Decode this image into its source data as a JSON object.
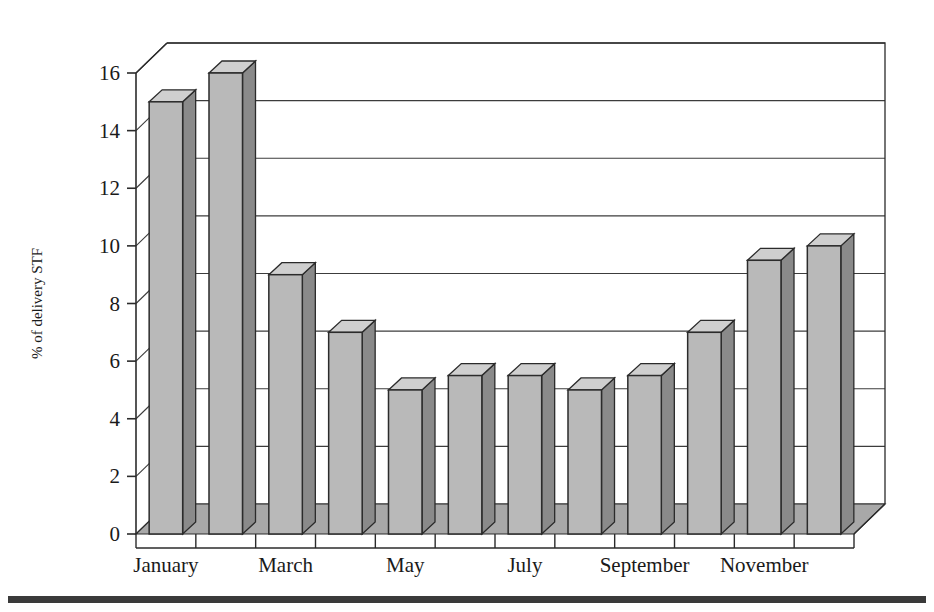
{
  "chart_data": {
    "type": "bar",
    "title": "",
    "subtitle": "",
    "xlabel": "",
    "ylabel": "% of delivery STF",
    "categories": [
      "January",
      "February",
      "March",
      "April",
      "May",
      "June",
      "July",
      "August",
      "September",
      "October",
      "November",
      "December"
    ],
    "values": [
      15,
      16,
      9,
      7,
      5,
      5.5,
      5.5,
      5,
      5.5,
      7,
      9.5,
      10
    ],
    "series": [
      {
        "name": "% of delivery STF",
        "values": [
          15,
          16,
          9,
          7,
          5,
          5.5,
          5.5,
          5,
          5.5,
          7,
          9.5,
          10
        ]
      }
    ],
    "ylim": [
      0,
      16
    ],
    "ytick_labels": [
      "0",
      "2",
      "4",
      "6",
      "8",
      "10",
      "12",
      "14",
      "16"
    ],
    "ytick_values": [
      0,
      2,
      4,
      6,
      8,
      10,
      12,
      14,
      16
    ],
    "xtick_labels": [
      "January",
      "",
      "March",
      "",
      "May",
      "",
      "July",
      "",
      "September",
      "",
      "November",
      ""
    ],
    "xtick_labels_shown": [
      "January",
      "March",
      "May",
      "July",
      "September",
      "November"
    ],
    "grid": "horizontal",
    "legend": "none",
    "style": "3d-columns"
  },
  "colors": {
    "bar_front": "#b9b9b9",
    "bar_side": "#8a8a8a",
    "bar_top": "#cfcfcf",
    "bar_outline": "#2b2b2b",
    "floor": "#a8a8a8",
    "floor_edge": "#2b2b2b",
    "grid": "#3c3c3c",
    "frame": "#2b2b2b",
    "text": "#1a1a1a",
    "rule": "#3a3a3a",
    "background": "#ffffff"
  },
  "footer": {
    "rule_present": "true"
  }
}
